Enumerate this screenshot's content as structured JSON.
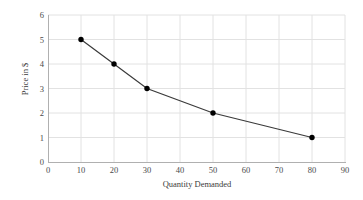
{
  "chart_data": {
    "type": "line",
    "title": "",
    "xlabel": "Quantity Demanded",
    "ylabel": "Price in $",
    "x": [
      10,
      20,
      30,
      50,
      80
    ],
    "values": [
      5,
      4,
      3,
      2,
      1
    ],
    "series": [
      {
        "name": "Demand",
        "x": [
          10,
          20,
          30,
          50,
          80
        ],
        "values": [
          5,
          4,
          3,
          2,
          1
        ]
      }
    ],
    "xlim": [
      0,
      90
    ],
    "ylim": [
      0,
      6
    ],
    "xticks": [
      0,
      10,
      20,
      30,
      40,
      50,
      60,
      70,
      80,
      90
    ],
    "yticks": [
      0,
      1,
      2,
      3,
      4,
      5,
      6
    ],
    "xtick_labels": [
      "0",
      "10",
      "20",
      "30",
      "40",
      "50",
      "60",
      "70",
      "80",
      "90"
    ],
    "ytick_labels": [
      "0",
      "1",
      "2",
      "3",
      "4",
      "5",
      "6"
    ],
    "grid": true,
    "legend": false,
    "legend_position": "none",
    "line_color": "#3a3a3a",
    "marker_color": "#000000",
    "grid_color": "#e2e2e2",
    "axis_color": "#b0b0b0",
    "background_color": "#ffffff"
  }
}
